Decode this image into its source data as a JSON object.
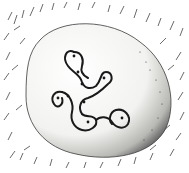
{
  "illustration": {
    "subject": "Carved stone with incised looping serpentine pattern in grass",
    "style": "pen-and-ink sketch",
    "colors": {
      "ink": "#1a1a1a",
      "paper": "#ffffff",
      "stone": "#f4f4f2",
      "shadow": "#6a6a6a"
    },
    "cup_marks": 9
  }
}
